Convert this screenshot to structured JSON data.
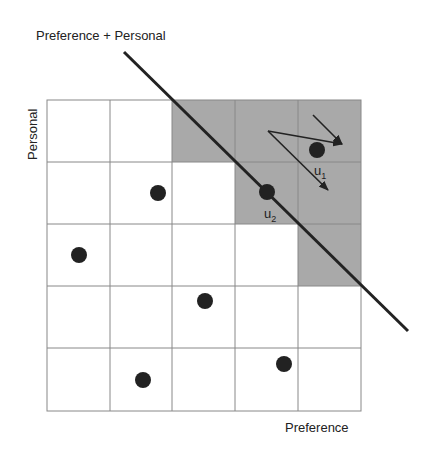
{
  "title": "Preference + Personal",
  "x_axis_label": "Preference",
  "y_axis_label": "Personal",
  "grid": {
    "rows": 5,
    "cols": 5,
    "shaded_cells": [
      [
        0,
        2
      ],
      [
        0,
        3
      ],
      [
        0,
        4
      ],
      [
        1,
        3
      ],
      [
        1,
        4
      ],
      [
        2,
        4
      ]
    ],
    "shade_color": "#a9a9a9",
    "line_color": "#888888"
  },
  "points": [
    {
      "row": 1,
      "col": 1,
      "label": ""
    },
    {
      "row": 2,
      "col": 0,
      "label": ""
    },
    {
      "row": 3,
      "col": 2,
      "label": ""
    },
    {
      "row": 4,
      "col": 1,
      "label": ""
    },
    {
      "row": 4,
      "col": 3,
      "label": ""
    },
    {
      "row": 1,
      "col": 3,
      "label": "u2"
    },
    {
      "row": 0,
      "col": 4,
      "label": "u1"
    }
  ],
  "labels": {
    "u1": "u",
    "u1_sub": "1",
    "u2": "u",
    "u2_sub": "2"
  },
  "decision_line": {
    "description": "diagonal boundary Preference + Personal"
  }
}
